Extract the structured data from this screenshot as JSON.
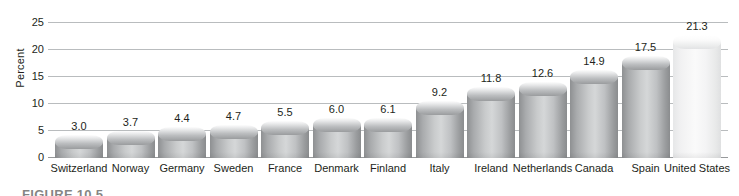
{
  "chart_data": {
    "type": "bar",
    "title": "",
    "xlabel": "",
    "ylabel": "Percent",
    "ylim": [
      0,
      25
    ],
    "yticks": [
      0,
      5,
      10,
      15,
      20,
      25
    ],
    "grid": true,
    "legend": "none",
    "categories": [
      "Switzerland",
      "Norway",
      "Germany",
      "Sweden",
      "France",
      "Denmark",
      "Finland",
      "Italy",
      "Ireland",
      "Netherlands",
      "Canada",
      "Spain",
      "United States"
    ],
    "values": [
      3.0,
      3.7,
      4.4,
      4.7,
      5.5,
      6.0,
      6.1,
      9.2,
      11.8,
      12.6,
      14.9,
      17.5,
      21.3
    ],
    "value_labels": [
      "3.0",
      "3.7",
      "4.4",
      "4.7",
      "5.5",
      "6.0",
      "6.1",
      "9.2",
      "11.8",
      "12.6",
      "14.9",
      "17.5",
      "21.3"
    ],
    "highlighted_category": "United States",
    "colors": {
      "bar": "#c3c5c7",
      "bar_highlight": "#f4f4f5",
      "gridline": "#b9bcbe",
      "text": "#231f20"
    }
  },
  "caption": {
    "text": "FIGURE 10.5"
  }
}
